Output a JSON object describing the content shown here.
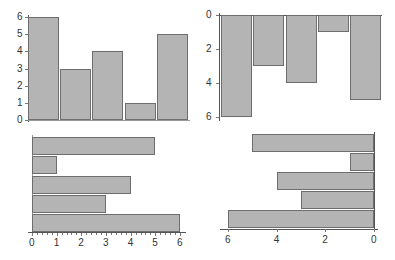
{
  "chart_data": [
    {
      "type": "bar",
      "orientation": "vertical",
      "position": "top-left",
      "categories": [
        "1",
        "2",
        "3",
        "4",
        "5"
      ],
      "values": [
        6,
        3,
        4,
        1,
        5
      ],
      "title": "",
      "xlabel": "",
      "ylabel": "",
      "ylim": [
        0,
        6
      ],
      "y_ticks": [
        "0",
        "1",
        "2",
        "3",
        "4",
        "5",
        "6"
      ],
      "grid": false,
      "bar_color": "#b4b4b4",
      "edge_color": "#6e6e6e"
    },
    {
      "type": "bar",
      "orientation": "vertical",
      "position": "top-right",
      "categories": [
        "1",
        "2",
        "3",
        "4",
        "5"
      ],
      "values": [
        6,
        3,
        4,
        1,
        5
      ],
      "title": "",
      "xlabel": "",
      "ylabel": "",
      "ylim": [
        6,
        0
      ],
      "y_axis_inverted": true,
      "y_ticks": [
        "0",
        "2",
        "4",
        "6"
      ],
      "grid": false,
      "bar_color": "#b4b4b4",
      "edge_color": "#6e6e6e"
    },
    {
      "type": "bar",
      "orientation": "horizontal",
      "position": "bottom-left",
      "categories": [
        "1",
        "2",
        "3",
        "4",
        "5"
      ],
      "values": [
        6,
        3,
        4,
        1,
        5
      ],
      "values_top_to_bottom": [
        5,
        1,
        4,
        3,
        6
      ],
      "title": "",
      "xlabel": "",
      "ylabel": "",
      "xlim": [
        0,
        6
      ],
      "x_ticks": [
        "0",
        "1",
        "2",
        "3",
        "4",
        "5",
        "6"
      ],
      "grid": false,
      "bar_color": "#b4b4b4",
      "edge_color": "#6e6e6e"
    },
    {
      "type": "bar",
      "orientation": "horizontal",
      "position": "bottom-right",
      "categories": [
        "1",
        "2",
        "3",
        "4",
        "5"
      ],
      "values": [
        6,
        3,
        4,
        1,
        5
      ],
      "values_top_to_bottom": [
        5,
        1,
        4,
        3,
        6
      ],
      "title": "",
      "xlabel": "",
      "ylabel": "",
      "xlim": [
        6,
        0
      ],
      "x_axis_inverted": true,
      "x_ticks": [
        "6",
        "4",
        "2",
        "0"
      ],
      "grid": false,
      "bar_color": "#b4b4b4",
      "edge_color": "#6e6e6e"
    }
  ]
}
